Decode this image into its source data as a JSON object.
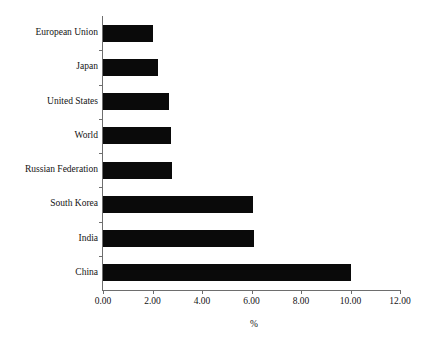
{
  "chart_data": {
    "type": "bar",
    "orientation": "horizontal",
    "title": "",
    "subtitle": "",
    "xlabel": "%",
    "ylabel": "",
    "categories": [
      "European Union",
      "Japan",
      "United States",
      "World",
      "Russian Federation",
      "South Korea",
      "India",
      "China"
    ],
    "values": [
      2.0,
      2.2,
      2.65,
      2.75,
      2.8,
      6.05,
      6.1,
      10.0
    ],
    "series": [
      {
        "name": "%",
        "values": [
          2.0,
          2.2,
          2.65,
          2.75,
          2.8,
          6.05,
          6.1,
          10.0
        ]
      }
    ],
    "xlim": [
      0,
      12
    ],
    "xticks": [
      0,
      2,
      4,
      6,
      8,
      10,
      12
    ],
    "xtick_labels": [
      "0.00",
      "2.00",
      "4.00",
      "6.00",
      "8.00",
      "10.00",
      "12.00"
    ],
    "grid": false,
    "legend": false,
    "legend_position": "none",
    "bar_color": "#0a0a0a",
    "axis_color": "#6e6e6e",
    "background_color": "#ffffff",
    "text_color": "#141414"
  }
}
